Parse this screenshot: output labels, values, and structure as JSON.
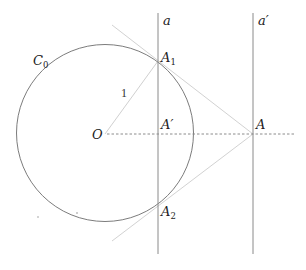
{
  "diagram": {
    "type": "geometry",
    "circle": {
      "label": "C",
      "label_sub": "0",
      "radius_label": "1"
    },
    "center": {
      "label": "O"
    },
    "lines": [
      {
        "name": "a",
        "label": "a"
      },
      {
        "name": "a-prime",
        "label": "a′"
      }
    ],
    "points": {
      "A1": {
        "label": "A",
        "sub": "1"
      },
      "A2": {
        "label": "A",
        "sub": "2"
      },
      "A_prime": {
        "label": "A′"
      },
      "A": {
        "label": "A"
      }
    },
    "colors": {
      "circle": "#7a7a7a",
      "vertical_lines": "#8a8a8a",
      "tangent_lines": "#cfcfcf",
      "dashed_axis": "#8c8c8c",
      "radius": "#cfcfcf",
      "text": "#222222"
    }
  }
}
